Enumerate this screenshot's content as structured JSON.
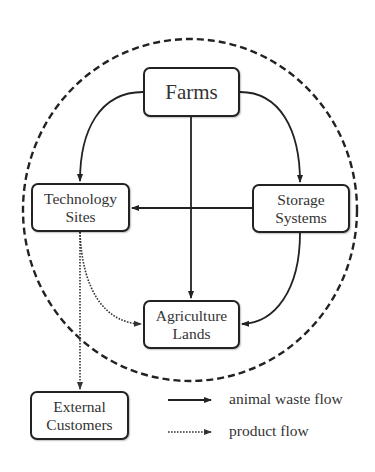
{
  "diagram": {
    "type": "flow-diagram",
    "boundary": {
      "style": "dashed-ellipse",
      "description": "system boundary enclosing farms, technology sites, storage systems and agriculture lands"
    },
    "nodes": {
      "farms": {
        "label": "Farms"
      },
      "technology_sites": {
        "line1": "Technology",
        "line2": "Sites"
      },
      "storage_systems": {
        "line1": "Storage",
        "line2": "Systems"
      },
      "agriculture_lands": {
        "line1": "Agriculture",
        "line2": "Lands"
      },
      "external_customers": {
        "line1": "External",
        "line2": "Customers"
      }
    },
    "edges": [
      {
        "from": "Farms",
        "to": "Technology Sites",
        "type": "animal waste flow"
      },
      {
        "from": "Farms",
        "to": "Storage Systems",
        "type": "animal waste flow"
      },
      {
        "from": "Farms",
        "to": "Agriculture Lands",
        "type": "animal waste flow"
      },
      {
        "from": "Storage Systems",
        "to": "Technology Sites",
        "type": "animal waste flow"
      },
      {
        "from": "Storage Systems",
        "to": "Agriculture Lands",
        "type": "animal waste flow"
      },
      {
        "from": "Technology Sites",
        "to": "Agriculture Lands",
        "type": "product flow"
      },
      {
        "from": "Technology Sites",
        "to": "External Customers",
        "type": "product flow"
      }
    ],
    "legend": {
      "solid": "animal waste flow",
      "dotted": "product flow"
    },
    "colors": {
      "line": "#222222",
      "text": "#333333",
      "background": "#ffffff"
    }
  }
}
